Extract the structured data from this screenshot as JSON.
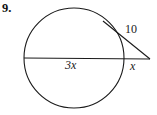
{
  "problem": {
    "number": "9."
  },
  "figure": {
    "type": "geometry-diagram",
    "stroke_color": "#1a1a1a",
    "background_color": "#ffffff",
    "circle": {
      "center_x": 74,
      "center_y": 58,
      "radius": 50
    },
    "tangent_point": {
      "x": 103,
      "y": 21
    },
    "external_point": {
      "x": 150,
      "y": 59
    },
    "secant_start": {
      "x": 24,
      "y": 58
    },
    "secant_circle_exit": {
      "x": 124,
      "y": 58
    }
  },
  "labels": {
    "tangent_length": "10",
    "secant_chord": "3x",
    "secant_external": "x"
  }
}
